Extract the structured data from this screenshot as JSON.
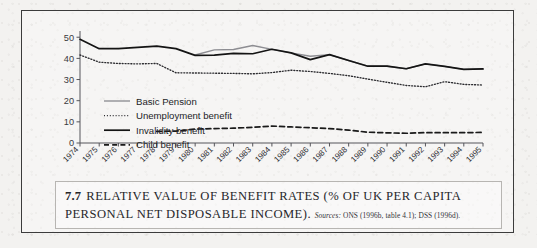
{
  "figure": {
    "caption_number": "7.7",
    "caption_line1": "RELATIVE VALUE OF BENEFIT RATES (% OF UK PER CAPITA",
    "caption_line2": "PERSONAL NET DISPOSABLE INCOME).",
    "sources_label": "Sources:",
    "sources_text": "ONS (1996b, table 4.1); DSS (1996d)."
  },
  "colors": {
    "axis": "#55555a",
    "invalidity": "#141414",
    "basic_pension": "#8d8d92",
    "unemployment": "#2b2b2f",
    "child": "#1a1a1a",
    "frame": "#3c3c3c",
    "paper": "#f3f2f0"
  },
  "chart_data": {
    "type": "line",
    "title": "",
    "xlabel": "",
    "ylabel": "",
    "ylim": [
      0,
      52
    ],
    "yticks": [
      0,
      10,
      20,
      30,
      40,
      50
    ],
    "grid": false,
    "legend_position": "inside-left",
    "categories": [
      1974,
      1975,
      1976,
      1977,
      1978,
      1979,
      1980,
      1981,
      1982,
      1983,
      1984,
      1985,
      1986,
      1987,
      1988,
      1989,
      1990,
      1991,
      1992,
      1993,
      1994,
      1995
    ],
    "xtick_labels": [
      "1974",
      "1975",
      "1976",
      "1977",
      "1978",
      "1979",
      "1980",
      "1981",
      "1982",
      "1983",
      "1984",
      "1985",
      "1986",
      "1987",
      "1988",
      "1989",
      "1990",
      "1991",
      "1992",
      "1993",
      "1994",
      "1995"
    ],
    "series": [
      {
        "name": "Basic Pension",
        "style": "solid-grey",
        "color": "#8d8d92",
        "start_index": 6,
        "values": [
          null,
          null,
          null,
          null,
          null,
          null,
          41.6,
          44.0,
          44.2,
          46.1,
          44.3,
          42.6,
          41.0,
          41.8,
          39.0,
          36.3,
          36.3,
          35.1,
          37.4,
          36.2,
          34.8,
          35.0
        ]
      },
      {
        "name": "Unemployment benefit",
        "style": "dotted",
        "color": "#2b2b2f",
        "start_index": 0,
        "values": [
          41.6,
          38.2,
          37.6,
          37.4,
          37.6,
          33.2,
          33.1,
          33.0,
          32.9,
          32.7,
          33.3,
          34.4,
          33.8,
          32.9,
          31.8,
          30.2,
          28.7,
          27.2,
          26.6,
          29.0,
          27.7,
          27.4
        ]
      },
      {
        "name": "Invalidity benefit",
        "style": "solid-black",
        "color": "#141414",
        "start_index": 0,
        "values": [
          49.0,
          44.6,
          44.6,
          45.2,
          45.8,
          44.6,
          41.4,
          41.5,
          42.4,
          42.2,
          44.3,
          42.6,
          39.4,
          41.8,
          39.0,
          36.3,
          36.3,
          35.1,
          37.4,
          36.2,
          34.8,
          35.0
        ]
      },
      {
        "name": "Child benefit",
        "style": "dashed",
        "color": "#1a1a1a",
        "start_index": 4,
        "values": [
          null,
          null,
          null,
          null,
          5.5,
          5.6,
          6.6,
          6.8,
          7.0,
          7.4,
          8.0,
          7.6,
          7.2,
          6.8,
          6.1,
          5.1,
          4.8,
          4.6,
          4.9,
          4.9,
          4.9,
          5.0
        ]
      }
    ]
  }
}
